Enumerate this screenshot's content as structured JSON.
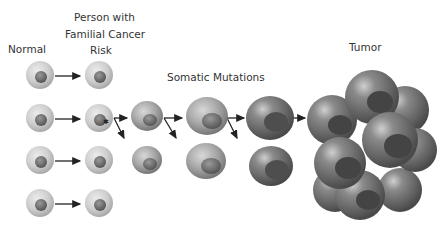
{
  "labels": {
    "normal": "Normal",
    "familial_line1": "Person with",
    "familial_line2": "Familial Cancer",
    "familial_line3": "Risk",
    "somatic": "Somatic Mutations",
    "tumor": "Tumor"
  },
  "colors": {
    "normal_cell": "#c9c9c9",
    "nucleus": "#7a7a7a",
    "mutated_cell": "#9a9a9a",
    "tumor_cell": "#6e6e6e",
    "arrow": "#222222",
    "text": "#333333"
  }
}
